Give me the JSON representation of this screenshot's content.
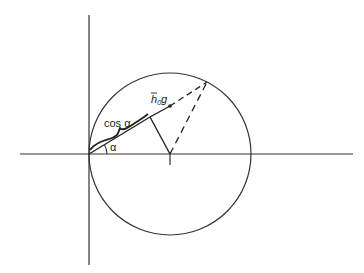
{
  "diagram": {
    "labels": {
      "cos_alpha": "cos α",
      "alpha": "α",
      "hbar": "h",
      "hbar_sub": "0",
      "hbar_g": "g",
      "center_tick": "I"
    },
    "colors": {
      "stroke": "#222222",
      "background": "#ffffff"
    }
  }
}
